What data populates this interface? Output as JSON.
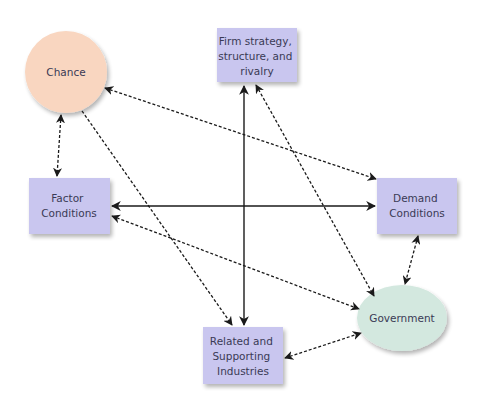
{
  "diagram": {
    "type": "porter-diamond",
    "colors": {
      "box_fill": "#c9c6ef",
      "chance_fill": "#f9d6c0",
      "government_fill": "#d3e8df",
      "line": "#1a1a1a",
      "text": "#3a3a55"
    },
    "nodes": {
      "chance": {
        "label": [
          "Chance"
        ],
        "shape": "circle"
      },
      "firm": {
        "label": [
          "Firm strategy,",
          "structure, and",
          "rivalry"
        ],
        "shape": "box"
      },
      "factor": {
        "label": [
          "Factor",
          "Conditions"
        ],
        "shape": "box"
      },
      "demand": {
        "label": [
          "Demand",
          "Conditions"
        ],
        "shape": "box"
      },
      "related": {
        "label": [
          "Related and",
          "Supporting",
          "Industries"
        ],
        "shape": "box"
      },
      "government": {
        "label": [
          "Government"
        ],
        "shape": "ellipse"
      }
    },
    "edges": [
      {
        "from": "firm",
        "to": "related",
        "style": "solid",
        "direction": "both"
      },
      {
        "from": "factor",
        "to": "demand",
        "style": "solid",
        "direction": "both"
      },
      {
        "from": "chance",
        "to": "demand",
        "style": "dashed",
        "direction": "both"
      },
      {
        "from": "chance",
        "to": "factor",
        "style": "dashed",
        "direction": "both"
      },
      {
        "from": "chance",
        "to": "related",
        "style": "dashed",
        "direction": "one-way"
      },
      {
        "from": "firm",
        "to": "government",
        "style": "dashed",
        "direction": "both"
      },
      {
        "from": "factor",
        "to": "government",
        "style": "dashed",
        "direction": "both"
      },
      {
        "from": "demand",
        "to": "government",
        "style": "dashed",
        "direction": "both"
      },
      {
        "from": "related",
        "to": "government",
        "style": "dashed",
        "direction": "both"
      }
    ]
  }
}
